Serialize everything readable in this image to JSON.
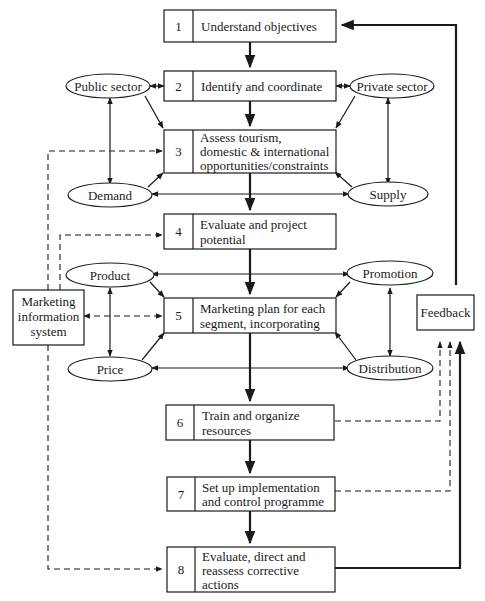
{
  "diagram": {
    "type": "flowchart",
    "steps": [
      {
        "num": "1",
        "lines": [
          "Understand objectives"
        ]
      },
      {
        "num": "2",
        "lines": [
          "Identify and coordinate"
        ]
      },
      {
        "num": "3",
        "lines": [
          "Assess tourism,",
          "domestic & international",
          "opportunities/constraints"
        ]
      },
      {
        "num": "4",
        "lines": [
          "Evaluate and project",
          "potential"
        ]
      },
      {
        "num": "5",
        "lines": [
          "Marketing plan for each",
          "segment, incorporating"
        ]
      },
      {
        "num": "6",
        "lines": [
          "Train and organize",
          "resources"
        ]
      },
      {
        "num": "7",
        "lines": [
          "Set up implementation",
          "and control programme"
        ]
      },
      {
        "num": "8",
        "lines": [
          "Evaluate, direct and",
          "reassess corrective",
          "actions"
        ]
      }
    ],
    "ellipses": {
      "public_sector": "Public sector",
      "private_sector": "Private sector",
      "demand": "Demand",
      "supply": "Supply",
      "product": "Product",
      "promotion": "Promotion",
      "price": "Price",
      "distribution": "Distribution"
    },
    "side_boxes": {
      "mis": [
        "Marketing",
        "information",
        "system"
      ],
      "feedback": [
        "Feedback"
      ]
    }
  }
}
